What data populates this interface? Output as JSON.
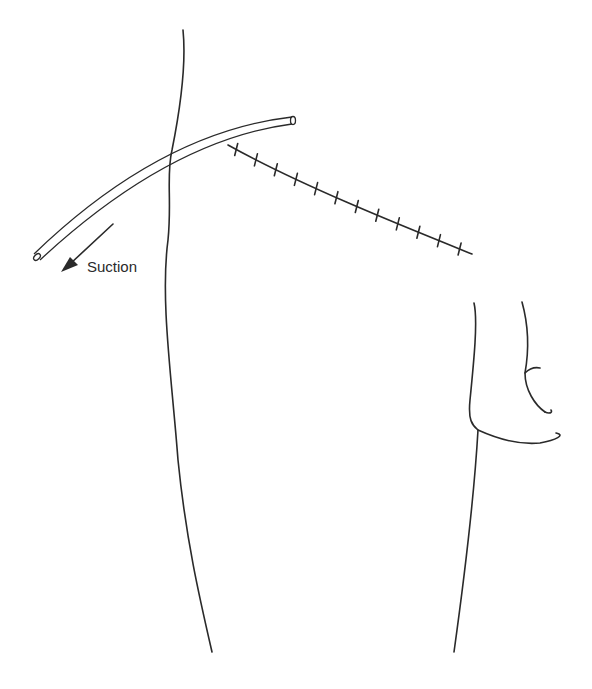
{
  "figure": {
    "labels": {
      "suction": "Suction"
    },
    "suture_stitch_count": 12,
    "colors": {
      "ink": "#2a2a2a",
      "background": "#ffffff"
    }
  }
}
